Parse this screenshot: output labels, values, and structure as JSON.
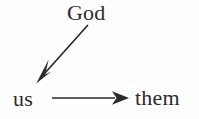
{
  "figure": {
    "kind": "concept-diagram",
    "background_color": "#fefefe",
    "ink_color": "#2b2b2e",
    "nodes": [
      {
        "id": "god",
        "label": "God",
        "x": 91,
        "y": 13
      },
      {
        "id": "us",
        "label": "us",
        "x": 27,
        "y": 99
      },
      {
        "id": "them",
        "label": "them",
        "x": 160,
        "y": 99
      }
    ],
    "arrows": [
      {
        "id": "god-to-us",
        "from": "god",
        "to": "us",
        "orientation": "diagonal-down-left",
        "head_style": "barbed",
        "x1": 88,
        "y1": 26,
        "x2": 37,
        "y2": 83
      },
      {
        "id": "us-to-them",
        "from": "us",
        "to": "them",
        "orientation": "horizontal-right",
        "head_style": "barbed",
        "x1": 52,
        "y1": 98,
        "x2": 129,
        "y2": 98
      }
    ]
  }
}
